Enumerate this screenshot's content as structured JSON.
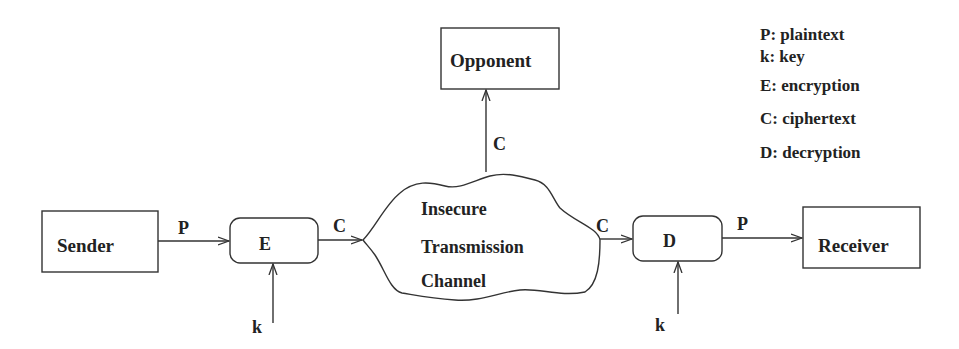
{
  "diagram": {
    "nodes": {
      "sender": "Sender",
      "encrypt": "E",
      "channel": [
        "Insecure",
        "Transmission",
        "Channel"
      ],
      "opponent": "Opponent",
      "decrypt": "D",
      "receiver": "Receiver"
    },
    "edges": {
      "sender_to_e": "P",
      "key_to_e": "k",
      "e_to_channel": "C",
      "channel_to_opponent": "C",
      "channel_to_d": "C",
      "key_to_d": "k",
      "d_to_receiver": "P"
    },
    "legend": [
      "P: plaintext",
      "k: key",
      "E: encryption",
      "C: ciphertext",
      "D: decryption"
    ],
    "colors": {
      "stroke": "#333333",
      "text": "#222222",
      "background": "#ffffff"
    }
  }
}
